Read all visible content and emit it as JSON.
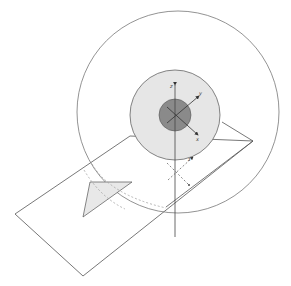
{
  "diagram": {
    "colors": {
      "stroke": "#555555",
      "outer_circle_stroke": "#777777",
      "mid_disc_fill": "#e6e6e6",
      "inner_disc_fill": "#8a8a8a",
      "triangle_fill": "#e8e8e8",
      "dashed": "#999999",
      "background": "#ffffff"
    },
    "axes_top": {
      "z_label": "z",
      "y_label": "y",
      "x_label": "x"
    },
    "axes_bottom": {
      "label": "z"
    },
    "shapes": [
      "outer-circle",
      "mid-disc",
      "inner-disc",
      "plane",
      "triangle",
      "dashed-arcs",
      "vertical-axis"
    ]
  }
}
